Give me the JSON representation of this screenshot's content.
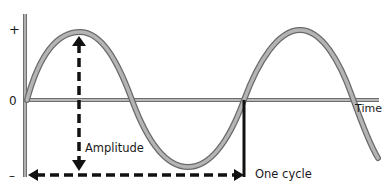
{
  "diagram": {
    "axis_labels": {
      "plus": "+",
      "zero": "0",
      "minus": "–",
      "time": "Time"
    },
    "annotations": {
      "amplitude": "Amplitude",
      "one_cycle": "One cycle"
    },
    "colors": {
      "wave_fill": "#a8a8a8",
      "wave_edge": "#6e6e6e",
      "axis": "#8a8a8a",
      "arrow": "#111111",
      "text": "#1a1a1a"
    }
  }
}
